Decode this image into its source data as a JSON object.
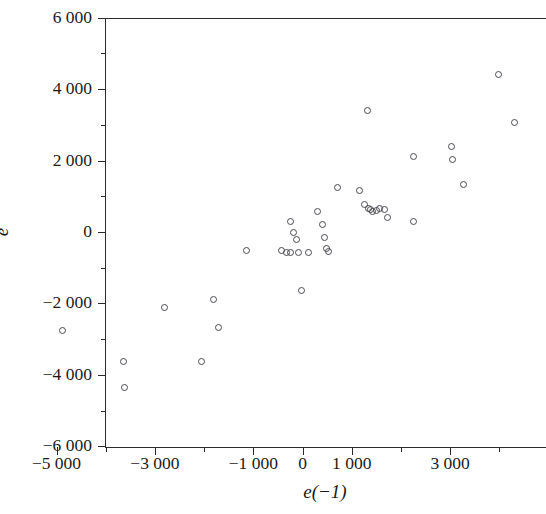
{
  "figure": {
    "background": "#ffffff",
    "point_color": "#4a4a50",
    "axis_color": "#2b2b2b"
  },
  "axis_titles": {
    "y": "e",
    "x": "e(−1)"
  },
  "y_ticks": [
    {
      "value": 6000,
      "label": "6 000"
    },
    {
      "value": 4000,
      "label": "4 000"
    },
    {
      "value": 2000,
      "label": "2 000"
    },
    {
      "value": 0,
      "label": "0"
    },
    {
      "value": -2000,
      "label": "−2 000"
    },
    {
      "value": -4000,
      "label": "−4 000"
    },
    {
      "value": -6000,
      "label": "−6 000"
    }
  ],
  "y_minor_ticks": [
    5000,
    3000,
    1000,
    -1000,
    -3000,
    -5000
  ],
  "x_ticks": [
    {
      "value": -5000,
      "label": "−5 000"
    },
    {
      "value": -3000,
      "label": "−3 000"
    },
    {
      "value": -1000,
      "label": "−1 000"
    },
    {
      "value": 0,
      "label": "0"
    },
    {
      "value": 1000,
      "label": "1 000"
    },
    {
      "value": 3000,
      "label": "3 000"
    }
  ],
  "x_minor_ticks": [
    -4000,
    -2000,
    2000,
    4000
  ],
  "chart_data": {
    "type": "scatter",
    "title": "",
    "xlabel": "e(−1)",
    "ylabel": "e",
    "xlim": [
      -5300,
      3660
    ],
    "ylim": [
      -6000,
      6000
    ],
    "grid": false,
    "legend": null,
    "marker": "open-circle",
    "n_points": 38,
    "points": [
      {
        "x": -4880,
        "y": -2750
      },
      {
        "x": -3640,
        "y": -3630
      },
      {
        "x": -3620,
        "y": -4340
      },
      {
        "x": -2800,
        "y": -2100
      },
      {
        "x": -2050,
        "y": -3620
      },
      {
        "x": -1800,
        "y": -1880
      },
      {
        "x": -1700,
        "y": -2670
      },
      {
        "x": -1130,
        "y": -520
      },
      {
        "x": -430,
        "y": -520
      },
      {
        "x": -320,
        "y": -560
      },
      {
        "x": -250,
        "y": -560
      },
      {
        "x": -240,
        "y": 280
      },
      {
        "x": -180,
        "y": -20
      },
      {
        "x": -130,
        "y": -200
      },
      {
        "x": -80,
        "y": -560
      },
      {
        "x": -20,
        "y": -1650
      },
      {
        "x": 130,
        "y": -560
      },
      {
        "x": 300,
        "y": 560
      },
      {
        "x": 400,
        "y": 220
      },
      {
        "x": 440,
        "y": -150
      },
      {
        "x": 480,
        "y": -450
      },
      {
        "x": 520,
        "y": -550
      },
      {
        "x": 710,
        "y": 1250
      },
      {
        "x": 1160,
        "y": 1150
      },
      {
        "x": 1270,
        "y": 760
      },
      {
        "x": 1340,
        "y": 660
      },
      {
        "x": 1390,
        "y": 620
      },
      {
        "x": 1430,
        "y": 560
      },
      {
        "x": 1500,
        "y": 600
      },
      {
        "x": 1560,
        "y": 660
      },
      {
        "x": 1660,
        "y": 630
      },
      {
        "x": 1720,
        "y": 400
      },
      {
        "x": 2260,
        "y": 280
      },
      {
        "x": 2260,
        "y": 2100
      },
      {
        "x": 3020,
        "y": 2400
      },
      {
        "x": 3040,
        "y": 2030
      },
      {
        "x": 3270,
        "y": 1340
      },
      {
        "x": 3980,
        "y": 4400
      },
      {
        "x": 4300,
        "y": 3060
      },
      {
        "x": 1320,
        "y": 3400
      }
    ]
  }
}
